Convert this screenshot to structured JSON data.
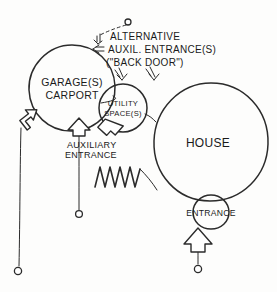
{
  "diagram": {
    "title_present": false,
    "style": "hand-drawn bubble diagram",
    "ink_color": "#2b2b2b",
    "paper_color": "#fdfdfc",
    "nodes": [
      {
        "id": "garage",
        "lines": [
          "GARAGE(S)",
          "CARPORT"
        ],
        "shape": "circle",
        "cx": 72,
        "cy": 88,
        "r": 43
      },
      {
        "id": "utility",
        "lines": [
          "UTILITY",
          "SPACE(S)"
        ],
        "shape": "circle",
        "cx": 123,
        "cy": 108,
        "r": 24
      },
      {
        "id": "house",
        "lines": [
          "HOUSE"
        ],
        "shape": "circle",
        "cx": 211,
        "cy": 142,
        "r": 59
      },
      {
        "id": "entrance",
        "lines": [
          "ENTRANCE"
        ],
        "shape": "circle",
        "cx": 211,
        "cy": 212,
        "r": 17
      }
    ],
    "annotations": [
      {
        "id": "alternative-auxiliary",
        "lines": [
          "ALTERNATIVE",
          "AUXIL. ENTRANCE(S)",
          "(\"BACK DOOR\")"
        ],
        "x": 110,
        "y": 34
      },
      {
        "id": "auxiliary-entrance",
        "lines": [
          "AUXILIARY",
          "ENTRANCE"
        ],
        "x": 67,
        "y": 146
      }
    ],
    "markers": {
      "zigzag_label": "wall-zigzag",
      "leader_dot_count": 2,
      "callout_dot_count": 1
    }
  }
}
